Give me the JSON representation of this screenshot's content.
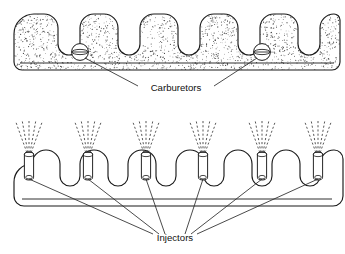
{
  "figure": {
    "background_color": "#ffffff",
    "line_color": "#1a1a1a",
    "stipple_color": "#4a4a4a",
    "width": 345,
    "height": 254
  },
  "panels": [
    {
      "id": "carbureted-manifold",
      "name": "Carbureted intake manifold",
      "runner_count": 6,
      "surface": "stippled",
      "callout": {
        "label": "Carburetors",
        "label_x": 176,
        "label_y": 88,
        "device_count": 2,
        "devices": [
          {
            "name": "carburetor-left",
            "cx": 80,
            "cy": 52,
            "r": 8.4
          },
          {
            "name": "carburetor-right",
            "cx": 262,
            "cy": 52,
            "r": 8.4
          }
        ]
      }
    },
    {
      "id": "fuel-injected-manifold",
      "name": "Fuel injected intake manifold",
      "runner_count": 6,
      "surface": "outline",
      "callout": {
        "label": "Injectors",
        "label_x": 175,
        "label_y": 238,
        "device_count": 6,
        "devices": [
          {
            "name": "injector-1",
            "cx": 29,
            "cy": 160
          },
          {
            "name": "injector-2",
            "cx": 88,
            "cy": 160
          },
          {
            "name": "injector-3",
            "cx": 146,
            "cy": 160
          },
          {
            "name": "injector-4",
            "cx": 203,
            "cy": 160
          },
          {
            "name": "injector-5",
            "cx": 262,
            "cy": 160
          },
          {
            "name": "injector-6",
            "cx": 318,
            "cy": 160
          }
        ],
        "spray_lines_per_injector": 5
      }
    }
  ]
}
